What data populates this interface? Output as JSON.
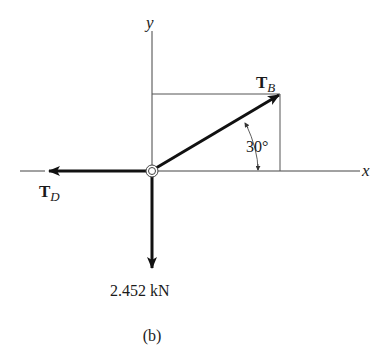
{
  "diagram": {
    "axes": {
      "x_label": "x",
      "y_label": "y"
    },
    "forces": {
      "tb": {
        "symbol": "T",
        "subscript": "B",
        "angle_label": "30°"
      },
      "td": {
        "symbol": "T",
        "subscript": "D"
      },
      "weight": {
        "label": "2.452 kN"
      }
    },
    "caption": "(b)"
  }
}
